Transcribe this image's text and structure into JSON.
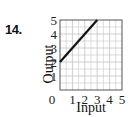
{
  "problem": {
    "number": "14."
  },
  "chart_data": {
    "type": "line",
    "title": "",
    "xlabel": "Input",
    "ylabel": "Output",
    "xlim": [
      0,
      5
    ],
    "ylim": [
      0,
      5
    ],
    "x_ticks": [
      "0",
      "1",
      "2",
      "3",
      "4",
      "5"
    ],
    "y_ticks": [
      "1",
      "2",
      "3",
      "4",
      "5"
    ],
    "grid": true,
    "legend": null,
    "series": [
      {
        "name": "line",
        "x": [
          0,
          3
        ],
        "y": [
          2,
          5
        ]
      }
    ],
    "colors": {
      "line": "#111111",
      "grid": "#c8c8c8",
      "frame": "#555555"
    }
  }
}
